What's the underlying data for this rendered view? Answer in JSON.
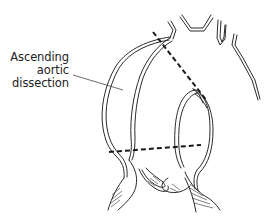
{
  "diagram": {
    "label": {
      "lines": [
        "Ascending",
        "aortic",
        "dissection"
      ]
    },
    "colors": {
      "ink": "#2a2a2a",
      "background": "#ffffff"
    },
    "elements": [
      "aortic arch outline",
      "supra-aortic branch vessels",
      "ascending aorta (dissected)",
      "outer dissected wall",
      "upper dashed resection line",
      "lower dashed resection line",
      "aortic root / sinus with valve leaflets",
      "left ventricular outflow (hatched)"
    ]
  }
}
